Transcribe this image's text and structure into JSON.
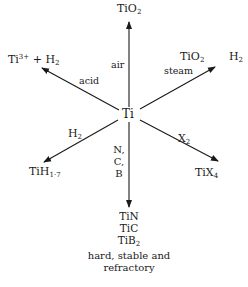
{
  "diagram": {
    "center": {
      "label": "Ti"
    },
    "branches": [
      {
        "direction": "up",
        "reagent": "air",
        "product_base": "TiO",
        "product_sub": "2"
      },
      {
        "direction": "up-right",
        "reagent": "steam",
        "product_base": "TiO",
        "product_sub": "2",
        "byproduct_base": "H",
        "byproduct_sub": "2"
      },
      {
        "direction": "down-right",
        "reagent_base": "X",
        "reagent_sub": "2",
        "product_base": "TiX",
        "product_sub": "4"
      },
      {
        "direction": "down",
        "reagents": [
          "N,",
          "C,",
          "B"
        ],
        "products": [
          "TiN",
          "TiC",
          "TiB"
        ],
        "product3_sub": "2",
        "note_line1": "hard, stable and",
        "note_line2": "refractory"
      },
      {
        "direction": "down-left",
        "reagent_base": "H",
        "reagent_sub": "2",
        "product_base": "TiH",
        "product_sub": "1·7"
      },
      {
        "direction": "up-left",
        "reagent": "acid",
        "product_base": "Ti",
        "product_sup": "3+",
        "product_rest": " + H",
        "product_rest_sub": "2"
      }
    ]
  }
}
